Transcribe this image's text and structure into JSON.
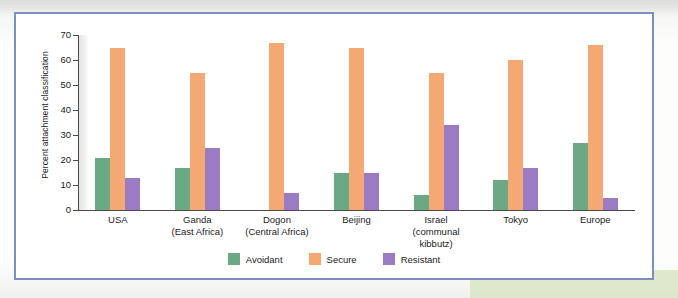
{
  "figure": {
    "frame_color": "#7b8fc4",
    "background_color": "#ffffff"
  },
  "chart_data": {
    "type": "bar",
    "title": "",
    "xlabel": "",
    "ylabel": "Percent attachment classification",
    "ylim": [
      0,
      70
    ],
    "ytick_step": 10,
    "yticks": [
      70,
      60,
      50,
      40,
      30,
      20,
      10,
      0
    ],
    "grid": false,
    "legend_position": "bottom-center",
    "categories": [
      {
        "label": "USA",
        "sub": ""
      },
      {
        "label": "Ganda",
        "sub": "(East Africa)"
      },
      {
        "label": "Dogon",
        "sub": "(Central Africa)"
      },
      {
        "label": "Beijing",
        "sub": ""
      },
      {
        "label": "Israel",
        "sub": "(communal kibbutz)"
      },
      {
        "label": "Tokyo",
        "sub": ""
      },
      {
        "label": "Europe",
        "sub": ""
      }
    ],
    "series": [
      {
        "name": "Avoidant",
        "color": "#6ba884",
        "values": [
          21,
          17,
          0,
          15,
          6,
          12,
          27
        ]
      },
      {
        "name": "Secure",
        "color": "#f4a873",
        "values": [
          65,
          55,
          67,
          65,
          55,
          60,
          66
        ]
      },
      {
        "name": "Resistant",
        "color": "#9b7cc4",
        "values": [
          13,
          25,
          7,
          15,
          34,
          17,
          5
        ]
      }
    ]
  }
}
